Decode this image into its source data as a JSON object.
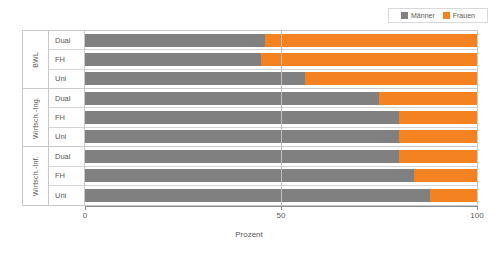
{
  "legend": {
    "entries": [
      {
        "label": "Männer",
        "color": "#808080",
        "icon": "legend-swatch-men"
      },
      {
        "label": "Frauen",
        "color": "#f58220",
        "icon": "legend-swatch-women"
      }
    ]
  },
  "axis": {
    "title": "Prozent",
    "ticks": [
      "0",
      "50",
      "100"
    ]
  },
  "groups": [
    {
      "label": "BWL",
      "rows": [
        {
          "label": "Dual"
        },
        {
          "label": "FH"
        },
        {
          "label": "Uni"
        }
      ]
    },
    {
      "label": "Wirtsch.-Ing.",
      "rows": [
        {
          "label": "Dual"
        },
        {
          "label": "FH"
        },
        {
          "label": "Uni"
        }
      ]
    },
    {
      "label": "Wirtsch.-Inf.",
      "rows": [
        {
          "label": "Dual"
        },
        {
          "label": "FH"
        },
        {
          "label": "Uni"
        }
      ]
    }
  ],
  "chart_data": {
    "type": "bar",
    "orientation": "horizontal",
    "stacked": true,
    "title": "",
    "xlabel": "Prozent",
    "ylabel": "",
    "xlim": [
      0,
      100
    ],
    "xticks": [
      0,
      50,
      100
    ],
    "grid": "vertical-at-50",
    "legend_position": "top-right",
    "categories": [
      "BWL / Dual",
      "BWL / FH",
      "BWL / Uni",
      "Wirtsch.-Ing. / Dual",
      "Wirtsch.-Ing. / FH",
      "Wirtsch.-Ing. / Uni",
      "Wirtsch.-Inf. / Dual",
      "Wirtsch.-Inf. / FH",
      "Wirtsch.-Inf. / Uni"
    ],
    "series": [
      {
        "name": "Männer",
        "color": "#808080",
        "values": [
          46,
          45,
          56,
          75,
          80,
          80,
          80,
          84,
          88
        ]
      },
      {
        "name": "Frauen",
        "color": "#f58220",
        "values": [
          54,
          55,
          44,
          25,
          20,
          20,
          20,
          16,
          12
        ]
      }
    ]
  }
}
